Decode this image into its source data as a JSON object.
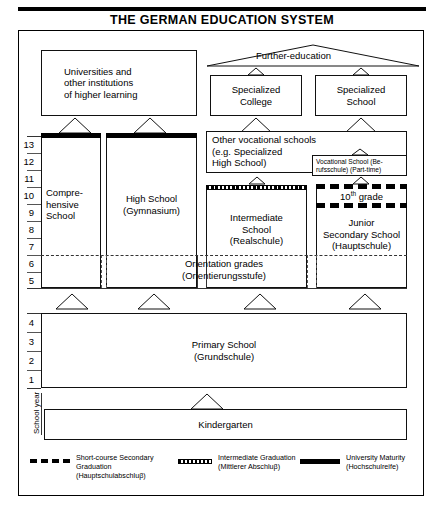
{
  "title": "THE GERMAN EDUCATION SYSTEM",
  "axis": {
    "vertical_label": "School year",
    "upper_grades": [
      "13",
      "12",
      "11",
      "10",
      "9",
      "8",
      "7",
      "6",
      "5"
    ],
    "lower_grades": [
      "4",
      "3",
      "2",
      "1"
    ]
  },
  "tertiary": {
    "universities": "Universities and\nother institutions\nof higher learning",
    "further_education_label": "Further-education",
    "specialized_college": "Specialized\nCollege",
    "specialized_school": "Specialized\nSchool"
  },
  "secondary": {
    "comprehensive": "Compre-\nhensive\nSchool",
    "high_school": "High School\n(Gymnasium)",
    "other_vocational": "Other vocational schools\n(e.g. Specialized\nHigh School)",
    "vocational_parttime": "Vocational School (Be-\nrufsschule) (Part-time)",
    "intermediate": "Intermediate\nSchool\n(Realschule)",
    "tenth_grade": "10",
    "tenth_grade_sup": "th",
    "tenth_grade_rest": " grade",
    "junior_secondary": "Junior\nSecondary School\n(Hauptschule)"
  },
  "orientation": {
    "text": "Orientation grades\n(Orientierungsstufe)"
  },
  "primary": {
    "text": "Primary School\n(Grundschule)"
  },
  "kindergarten": {
    "text": "Kindergarten"
  },
  "legend": [
    {
      "swatch": "short-course-dashed",
      "text": "Short-course Secondary\nGraduation\n(Hauptschulabschluβ)"
    },
    {
      "swatch": "intermediate-checkered",
      "text": "Intermediate Graduation\n(Mittlerer Abschluβ)"
    },
    {
      "swatch": "university-solid",
      "text": "University Maturity\n(Hochschulreife)"
    }
  ],
  "colors": {
    "ink": "#000000",
    "paper": "#ffffff",
    "rule": "#333333"
  }
}
